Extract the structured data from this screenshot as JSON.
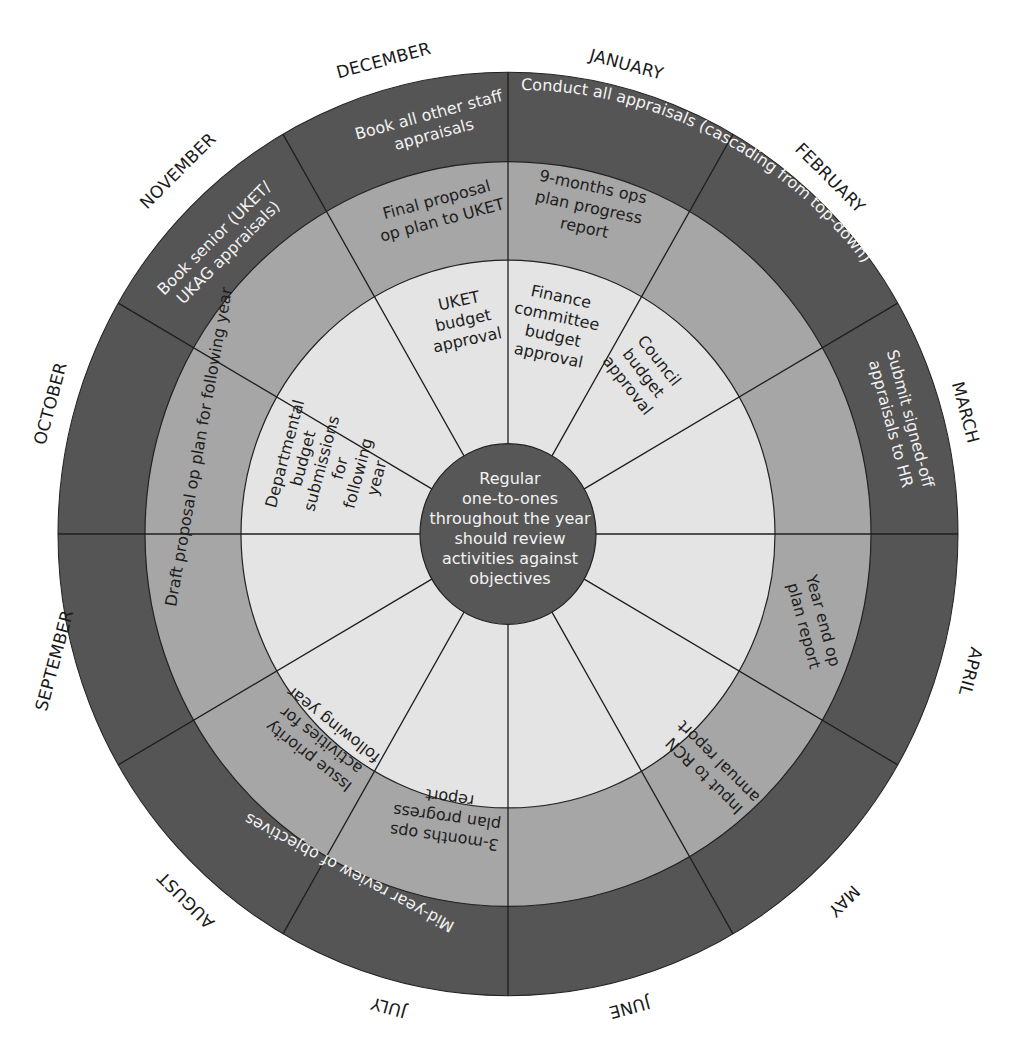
{
  "colors": {
    "outer_ring": "#555555",
    "middle_ring": "#a6a6a6",
    "inner_ring": "#e4e4e4",
    "center": "#575757",
    "divider": "#222222",
    "background": "#ffffff"
  },
  "months": [
    "JANUARY",
    "FEBRUARY",
    "MARCH",
    "APRIL",
    "MAY",
    "JUNE",
    "JULY",
    "AUGUST",
    "SEPTEMBER",
    "OCTOBER",
    "NOVEMBER",
    "DECEMBER"
  ],
  "center": {
    "lines": [
      "Regular",
      "one-to-ones",
      "throughout the year",
      "should review",
      "activities against",
      "objectives"
    ]
  },
  "outer_ring": {
    "conduct_appraisals": "Conduct all appraisals (cascading from top-down)",
    "book_other_staff": [
      "Book all other staff",
      "appraisals"
    ],
    "book_senior": [
      "Book senior (UKET/",
      "UKAG appraisals)"
    ],
    "submit_to_hr": [
      "Submit signed-off",
      "appraisals to HR"
    ],
    "mid_year_review": "Mid-year review of objectives"
  },
  "middle_ring": {
    "final_proposal": [
      "Final proposal",
      "op plan to UKET"
    ],
    "nine_months": [
      "9-months ops",
      "plan progress",
      "report"
    ],
    "year_end": [
      "Year end op",
      "plan report"
    ],
    "input_rcn": [
      "Input to RCN",
      "annual report"
    ],
    "three_months": [
      "3-months ops",
      "plan progress",
      "report"
    ],
    "issue_priority": [
      "Issue priority",
      "activities for",
      "following year"
    ],
    "draft_proposal": "Draft proposal op plan for following year"
  },
  "inner_ring": {
    "uket_budget": [
      "UKET",
      "budget",
      "approval"
    ],
    "finance_committee": [
      "Finance",
      "committee",
      "budget",
      "approval"
    ],
    "council_budget": [
      "Council",
      "budget",
      "approval"
    ],
    "departmental_budget": [
      "Departmental",
      "budget",
      "submissions",
      "for",
      "following",
      "year"
    ]
  }
}
